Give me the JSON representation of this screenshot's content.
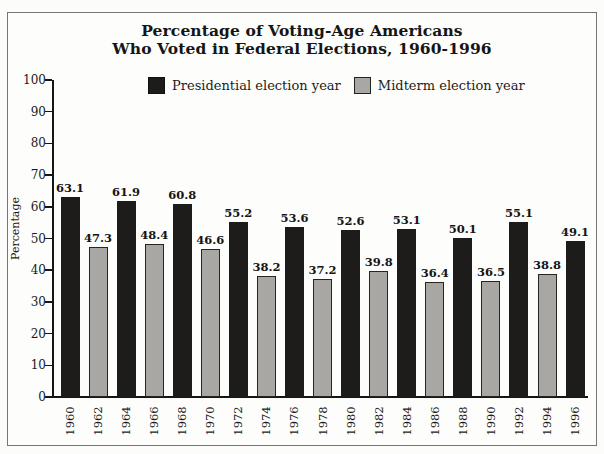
{
  "figure": {
    "title_line1": "Percentage of Voting-Age Americans",
    "title_line2": "Who Voted in Federal Elections, 1960-1996"
  },
  "legend": {
    "presidential_label": "Presidential election year",
    "midterm_label": "Midterm election year"
  },
  "chart_data": {
    "type": "bar",
    "title": "Percentage of Voting-Age Americans Who Voted in Federal Elections, 1960-1996",
    "xlabel": "",
    "ylabel": "Percentage",
    "ylim": [
      0,
      100
    ],
    "yticks": [
      0,
      10,
      20,
      30,
      40,
      50,
      60,
      70,
      80,
      90,
      100
    ],
    "grid": false,
    "legend_position": "top",
    "categories": [
      "1960",
      "1962",
      "1964",
      "1966",
      "1968",
      "1970",
      "1972",
      "1974",
      "1976",
      "1978",
      "1980",
      "1982",
      "1984",
      "1986",
      "1988",
      "1990",
      "1992",
      "1994",
      "1996"
    ],
    "values": [
      63.1,
      47.3,
      61.9,
      48.4,
      60.8,
      46.6,
      55.2,
      38.2,
      53.6,
      37.2,
      52.6,
      39.8,
      53.1,
      36.4,
      50.1,
      36.5,
      55.1,
      38.8,
      49.1
    ],
    "series_per_bar": [
      "presidential",
      "midterm",
      "presidential",
      "midterm",
      "presidential",
      "midterm",
      "presidential",
      "midterm",
      "presidential",
      "midterm",
      "presidential",
      "midterm",
      "presidential",
      "midterm",
      "presidential",
      "midterm",
      "presidential",
      "midterm",
      "presidential"
    ],
    "series": [
      {
        "name": "Presidential election year",
        "key": "presidential",
        "color": "#1d1c1a"
      },
      {
        "name": "Midterm election year",
        "key": "midterm",
        "color": "#a9a7a3"
      }
    ],
    "value_labels_shown": true
  }
}
